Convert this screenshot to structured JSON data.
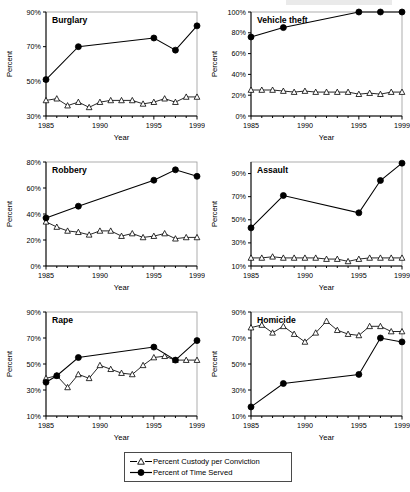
{
  "figure": {
    "axis_x_title": "Year",
    "axis_y_title": "Percent",
    "x_ticklabels": [
      "1985",
      "1990",
      "1995",
      "1999"
    ],
    "x_tickvalues": [
      1985,
      1990,
      1995,
      1999
    ],
    "xlim": [
      1985,
      1999
    ]
  },
  "legend": {
    "items": [
      {
        "label": "Percent Custody per Conviction",
        "marker": "open-triangle"
      },
      {
        "label": "Percent of Time Served",
        "marker": "filled-circle"
      }
    ]
  },
  "chart_data": [
    {
      "type": "line",
      "title": "Burglary",
      "xlabel": "Year",
      "ylabel": "Percent",
      "xlim": [
        1985,
        1999
      ],
      "ylim": [
        30,
        90
      ],
      "yticks": [
        30,
        50,
        70,
        90
      ],
      "yticklabels": [
        "30%",
        "50%",
        "70%",
        "90%"
      ],
      "xticks": [
        1985,
        1990,
        1995,
        1999
      ],
      "xticklabels": [
        "1985",
        "1990",
        "1995",
        "1999"
      ],
      "grid": false,
      "legend_position": "figure-bottom-center",
      "series": [
        {
          "name": "Percent Custody per Conviction",
          "marker": "open-triangle",
          "x": [
            1985,
            1986,
            1987,
            1988,
            1989,
            1990,
            1991,
            1992,
            1993,
            1994,
            1995,
            1996,
            1997,
            1998,
            1999
          ],
          "values": [
            39,
            40,
            36,
            38,
            35,
            38,
            39,
            39,
            39,
            37,
            38,
            40,
            38,
            41,
            41
          ]
        },
        {
          "name": "Percent of Time Served",
          "marker": "filled-circle",
          "x": [
            1985,
            1988,
            1995,
            1997,
            1999
          ],
          "values": [
            51,
            70,
            75,
            68,
            82
          ]
        }
      ]
    },
    {
      "type": "line",
      "title": "Vehicle theft",
      "xlabel": "Year",
      "ylabel": "Percent",
      "xlim": [
        1985,
        1999
      ],
      "ylim": [
        0,
        100
      ],
      "yticks": [
        0,
        20,
        40,
        60,
        80,
        100
      ],
      "yticklabels": [
        "0%",
        "20%",
        "40%",
        "60%",
        "80%",
        "100%"
      ],
      "xticks": [
        1985,
        1990,
        1995,
        1999
      ],
      "xticklabels": [
        "1985",
        "1990",
        "1995",
        "1999"
      ],
      "grid": false,
      "legend_position": "figure-bottom-center",
      "series": [
        {
          "name": "Percent Custody per Conviction",
          "marker": "open-triangle",
          "x": [
            1985,
            1986,
            1987,
            1988,
            1989,
            1990,
            1991,
            1992,
            1993,
            1994,
            1995,
            1996,
            1997,
            1998,
            1999
          ],
          "values": [
            25,
            25,
            25,
            24,
            23,
            24,
            23,
            23,
            23,
            23,
            21,
            22,
            21,
            23,
            23
          ]
        },
        {
          "name": "Percent of Time Served",
          "marker": "filled-circle",
          "x": [
            1985,
            1988,
            1995,
            1997,
            1999
          ],
          "values": [
            76,
            85,
            100,
            100,
            100
          ]
        }
      ]
    },
    {
      "type": "line",
      "title": "Robbery",
      "xlabel": "Year",
      "ylabel": "Percent",
      "xlim": [
        1985,
        1999
      ],
      "ylim": [
        0,
        80
      ],
      "yticks": [
        0,
        20,
        40,
        60,
        80
      ],
      "yticklabels": [
        "0%",
        "20%",
        "40%",
        "60%",
        "80%"
      ],
      "xticks": [
        1985,
        1990,
        1995,
        1999
      ],
      "xticklabels": [
        "1985",
        "1990",
        "1995",
        "1999"
      ],
      "grid": false,
      "legend_position": "figure-bottom-center",
      "series": [
        {
          "name": "Percent Custody per Conviction",
          "marker": "open-triangle",
          "x": [
            1985,
            1986,
            1987,
            1988,
            1989,
            1990,
            1991,
            1992,
            1993,
            1994,
            1995,
            1996,
            1997,
            1998,
            1999
          ],
          "values": [
            34,
            30,
            27,
            26,
            24,
            27,
            27,
            23,
            25,
            22,
            23,
            25,
            21,
            22,
            22
          ]
        },
        {
          "name": "Percent of Time Served",
          "marker": "filled-circle",
          "x": [
            1985,
            1988,
            1995,
            1997,
            1999
          ],
          "values": [
            37,
            46,
            66,
            74,
            69
          ]
        }
      ]
    },
    {
      "type": "line",
      "title": "Assault",
      "xlabel": "Year",
      "ylabel": "Percent",
      "xlim": [
        1985,
        1999
      ],
      "ylim": [
        10,
        100
      ],
      "yticks": [
        10,
        30,
        50,
        70,
        90
      ],
      "yticklabels": [
        "10%",
        "30%",
        "50%",
        "70%",
        "90%"
      ],
      "xticks": [
        1985,
        1990,
        1995,
        1999
      ],
      "xticklabels": [
        "1985",
        "1990",
        "1995",
        "1999"
      ],
      "grid": false,
      "legend_position": "figure-bottom-center",
      "series": [
        {
          "name": "Percent Custody per Conviction",
          "marker": "open-triangle",
          "x": [
            1985,
            1986,
            1987,
            1988,
            1989,
            1990,
            1991,
            1992,
            1993,
            1994,
            1995,
            1996,
            1997,
            1998,
            1999
          ],
          "values": [
            17,
            17,
            18,
            17,
            17,
            17,
            17,
            16,
            16,
            14,
            16,
            17,
            17,
            17,
            17
          ]
        },
        {
          "name": "Percent of Time Served",
          "marker": "filled-circle",
          "x": [
            1985,
            1988,
            1995,
            1997,
            1999
          ],
          "values": [
            43,
            71,
            56,
            84,
            99
          ]
        }
      ]
    },
    {
      "type": "line",
      "title": "Rape",
      "xlabel": "Year",
      "ylabel": "Percent",
      "xlim": [
        1985,
        1999
      ],
      "ylim": [
        10,
        90
      ],
      "yticks": [
        10,
        30,
        50,
        70,
        90
      ],
      "yticklabels": [
        "10%",
        "30%",
        "50%",
        "70%",
        "90%"
      ],
      "xticks": [
        1985,
        1990,
        1995,
        1999
      ],
      "xticklabels": [
        "1985",
        "1990",
        "1995",
        "1999"
      ],
      "grid": false,
      "legend_position": "figure-bottom-center",
      "series": [
        {
          "name": "Percent Custody per Conviction",
          "marker": "open-triangle",
          "x": [
            1985,
            1986,
            1987,
            1988,
            1989,
            1990,
            1991,
            1992,
            1993,
            1994,
            1995,
            1996,
            1997,
            1998,
            1999
          ],
          "values": [
            39,
            41,
            32,
            42,
            39,
            49,
            46,
            43,
            42,
            49,
            55,
            56,
            53,
            53,
            53
          ]
        },
        {
          "name": "Percent of Time Served",
          "marker": "filled-circle",
          "x": [
            1985,
            1986,
            1988,
            1995,
            1997,
            1999
          ],
          "values": [
            36,
            41,
            55,
            63,
            53,
            68
          ]
        }
      ]
    },
    {
      "type": "line",
      "title": "Homicide",
      "xlabel": "Year",
      "ylabel": "Percent",
      "xlim": [
        1985,
        1999
      ],
      "ylim": [
        10,
        90
      ],
      "yticks": [
        10,
        30,
        50,
        70,
        90
      ],
      "yticklabels": [
        "10%",
        "30%",
        "50%",
        "70%",
        "90%"
      ],
      "xticks": [
        1985,
        1990,
        1995,
        1999
      ],
      "xticklabels": [
        "1985",
        "1990",
        "1995",
        "1999"
      ],
      "grid": false,
      "legend_position": "figure-bottom-center",
      "series": [
        {
          "name": "Percent Custody per Conviction",
          "marker": "open-triangle",
          "x": [
            1985,
            1986,
            1987,
            1988,
            1989,
            1990,
            1991,
            1992,
            1993,
            1994,
            1995,
            1996,
            1997,
            1998,
            1999
          ],
          "values": [
            78,
            80,
            74,
            79,
            73,
            67,
            74,
            83,
            76,
            73,
            72,
            79,
            79,
            75,
            75
          ]
        },
        {
          "name": "Percent of Time Served",
          "marker": "filled-circle",
          "x": [
            1985,
            1988,
            1995,
            1997,
            1999
          ],
          "values": [
            17,
            35,
            42,
            70,
            67
          ]
        }
      ]
    }
  ]
}
